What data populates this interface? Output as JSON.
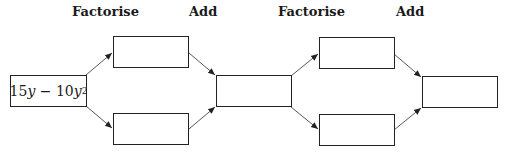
{
  "diagram": {
    "labels": [
      {
        "text": "Factorise",
        "x": 72
      },
      {
        "text": "Add",
        "x": 189
      },
      {
        "text": "Factorise",
        "x": 278
      },
      {
        "text": "Add",
        "x": 396
      }
    ],
    "start_expression": {
      "coef1": "15",
      "var1": "y",
      "operator": "−",
      "coef2": "10",
      "var2": "y",
      "exponent": "2"
    },
    "boxes": [
      {
        "id": "start",
        "x": 10,
        "y": 75,
        "w": 77,
        "h": 32
      },
      {
        "id": "factor-top-1",
        "x": 113,
        "y": 36,
        "w": 76,
        "h": 32,
        "value": ""
      },
      {
        "id": "factor-bottom-1",
        "x": 113,
        "y": 113,
        "w": 76,
        "h": 32,
        "value": ""
      },
      {
        "id": "sum-1",
        "x": 216,
        "y": 75,
        "w": 76,
        "h": 32,
        "value": ""
      },
      {
        "id": "factor-top-2",
        "x": 319,
        "y": 37,
        "w": 76,
        "h": 32,
        "value": ""
      },
      {
        "id": "factor-bottom-2",
        "x": 319,
        "y": 114,
        "w": 76,
        "h": 32,
        "value": ""
      },
      {
        "id": "sum-2",
        "x": 422,
        "y": 76,
        "w": 76,
        "h": 32,
        "value": ""
      }
    ],
    "arrows": [
      {
        "from": "start",
        "to": "factor-top-1"
      },
      {
        "from": "start",
        "to": "factor-bottom-1"
      },
      {
        "from": "factor-top-1",
        "to": "sum-1"
      },
      {
        "from": "factor-bottom-1",
        "to": "sum-1"
      },
      {
        "from": "sum-1",
        "to": "factor-top-2"
      },
      {
        "from": "sum-1",
        "to": "factor-bottom-2"
      },
      {
        "from": "factor-top-2",
        "to": "sum-2"
      },
      {
        "from": "factor-bottom-2",
        "to": "sum-2"
      }
    ]
  }
}
